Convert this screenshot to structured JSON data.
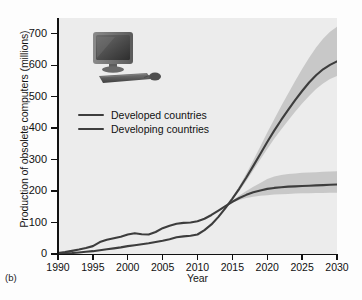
{
  "figure": {
    "panel_label": "(b)"
  },
  "icon": {
    "computer": "desktop-computer-icon"
  },
  "chart_data": {
    "type": "line",
    "title": "",
    "xlabel": "Year",
    "ylabel": "Production of obsolete computers (millions)",
    "xlim": [
      1990,
      2030
    ],
    "ylim": [
      0,
      750
    ],
    "xticks": [
      1990,
      1995,
      2000,
      2005,
      2010,
      2015,
      2020,
      2025,
      2030
    ],
    "yticks": [
      0,
      100,
      200,
      300,
      400,
      500,
      600,
      700
    ],
    "grid": false,
    "legend_position": "upper left",
    "series": [
      {
        "name": "Developed countries",
        "color": "#3d3d3d",
        "x": [
          1990,
          1991,
          1992,
          1993,
          1994,
          1995,
          1996,
          1997,
          1998,
          1999,
          2000,
          2001,
          2002,
          2003,
          2004,
          2005,
          2006,
          2007,
          2008,
          2009,
          2010,
          2011,
          2012,
          2013,
          2014,
          2015,
          2016,
          2017,
          2018,
          2019,
          2020,
          2021,
          2022,
          2023,
          2024,
          2025,
          2026,
          2027,
          2028,
          2029,
          2030
        ],
        "values": [
          3,
          6,
          10,
          14,
          19,
          25,
          38,
          45,
          50,
          55,
          62,
          66,
          63,
          62,
          70,
          82,
          90,
          96,
          99,
          100,
          104,
          112,
          124,
          138,
          152,
          166,
          178,
          188,
          196,
          202,
          207,
          210,
          212,
          214,
          215,
          216,
          217,
          218,
          219,
          220,
          221
        ],
        "band_low": [
          null,
          null,
          null,
          null,
          null,
          null,
          null,
          null,
          null,
          null,
          null,
          null,
          null,
          null,
          null,
          null,
          null,
          null,
          null,
          null,
          null,
          null,
          null,
          null,
          null,
          164,
          172,
          178,
          182,
          185,
          187,
          189,
          190,
          191,
          192,
          193,
          193,
          194,
          194,
          195,
          195
        ],
        "band_high": [
          null,
          null,
          null,
          null,
          null,
          null,
          null,
          null,
          null,
          null,
          null,
          null,
          null,
          null,
          null,
          null,
          null,
          null,
          null,
          null,
          null,
          null,
          null,
          null,
          null,
          170,
          186,
          200,
          214,
          226,
          238,
          246,
          251,
          254,
          256,
          258,
          259,
          260,
          261,
          262,
          263
        ]
      },
      {
        "name": "Developing countries",
        "color": "#3d3d3d",
        "x": [
          1990,
          1991,
          1992,
          1993,
          1994,
          1995,
          1996,
          1997,
          1998,
          1999,
          2000,
          2001,
          2002,
          2003,
          2004,
          2005,
          2006,
          2007,
          2008,
          2009,
          2010,
          2011,
          2012,
          2013,
          2014,
          2015,
          2016,
          2017,
          2018,
          2019,
          2020,
          2021,
          2022,
          2023,
          2024,
          2025,
          2026,
          2027,
          2028,
          2029,
          2030
        ],
        "values": [
          1,
          2,
          3,
          5,
          7,
          9,
          12,
          15,
          18,
          21,
          25,
          28,
          31,
          34,
          38,
          42,
          47,
          53,
          56,
          58,
          62,
          76,
          94,
          118,
          146,
          176,
          208,
          243,
          280,
          318,
          356,
          392,
          426,
          458,
          489,
          518,
          545,
          568,
          587,
          601,
          612
        ],
        "band_low": [
          null,
          null,
          null,
          null,
          null,
          null,
          null,
          null,
          null,
          null,
          null,
          null,
          null,
          null,
          null,
          null,
          null,
          null,
          null,
          null,
          null,
          null,
          null,
          null,
          null,
          172,
          200,
          232,
          266,
          300,
          334,
          366,
          396,
          424,
          452,
          478,
          502,
          524,
          542,
          556,
          566
        ],
        "band_high": [
          null,
          null,
          null,
          null,
          null,
          null,
          null,
          null,
          null,
          null,
          null,
          null,
          null,
          null,
          null,
          null,
          null,
          null,
          null,
          null,
          null,
          null,
          null,
          null,
          null,
          180,
          216,
          256,
          298,
          342,
          386,
          428,
          470,
          510,
          550,
          588,
          624,
          656,
          684,
          706,
          722
        ]
      }
    ],
    "band_color": "#c2c2c2",
    "plot_background": "#ececec"
  }
}
